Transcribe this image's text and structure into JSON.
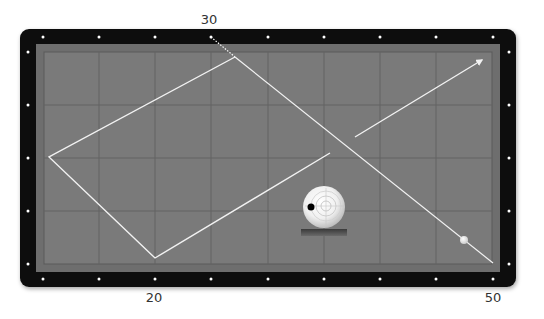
{
  "diagram": {
    "type": "billiards-three-cushion-system",
    "table": {
      "frame_color": "#0d0d0d",
      "cushion_color": "#6e6e6e",
      "cloth_color": "#7a7a7a",
      "grid_color": "#5f5f5f",
      "diamond_color": "#ffffff",
      "path_color": "#f2f2f2"
    },
    "labels": {
      "top": "30",
      "bottom_left": "20",
      "bottom_right": "50"
    },
    "balls": {
      "cue_ball_indicator": "cue-ball-spin-diagram",
      "object_ball": "white-ball-on-path"
    }
  }
}
